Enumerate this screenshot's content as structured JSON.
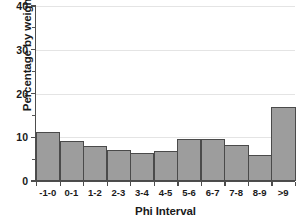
{
  "chart_data": {
    "type": "bar",
    "title": "",
    "xlabel": "Phi Interval",
    "ylabel": "Percentage by weight",
    "categories": [
      "-1-0",
      "0-1",
      "1-2",
      "2-3",
      "3-4",
      "4-5",
      "5-6",
      "6-7",
      "7-8",
      "8-9",
      ">9"
    ],
    "values": [
      11.2,
      9.2,
      8.1,
      7.1,
      6.4,
      6.9,
      9.5,
      9.5,
      8.3,
      6.0,
      17.0
    ],
    "ylim": [
      0,
      40
    ],
    "y_major_ticks": [
      0,
      10,
      20,
      30,
      40
    ],
    "y_minor_ticks": [
      5,
      15,
      25,
      35
    ],
    "y_tick_labels": [
      "0",
      "10",
      "20",
      "30",
      "40"
    ],
    "grid": "horizontal-major",
    "legend": "none",
    "bar_fill_color": "#9d9d9d",
    "bar_edge_color": "#4a4a4a",
    "axis_color": "#4d4d4d",
    "grid_color": "#e4e4e4"
  }
}
